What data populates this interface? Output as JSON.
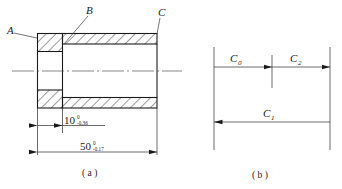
{
  "figure_a": {
    "caption": "( a )",
    "part_labels": [
      {
        "id": "A",
        "text": "A"
      },
      {
        "id": "B",
        "text": "B"
      },
      {
        "id": "C",
        "text": "C"
      }
    ],
    "dimensions": [
      {
        "id": "step-length",
        "nominal": "10",
        "upper_tolerance": "0",
        "lower_tolerance": "-0.36"
      },
      {
        "id": "overall-length",
        "nominal": "50",
        "upper_tolerance": "0",
        "lower_tolerance": "-0.17"
      }
    ]
  },
  "figure_b": {
    "caption": "( b )",
    "chain_links": [
      {
        "id": "C0",
        "base": "C",
        "sub": "0",
        "direction": "right"
      },
      {
        "id": "C2",
        "base": "C",
        "sub": "2",
        "direction": "right"
      },
      {
        "id": "C1",
        "base": "C",
        "sub": "1",
        "direction": "left"
      }
    ]
  },
  "colors": {
    "line": "#1a1a1a",
    "thin_line": "#2b2b2b",
    "centerline": "#555555",
    "background": "#ffffff"
  }
}
